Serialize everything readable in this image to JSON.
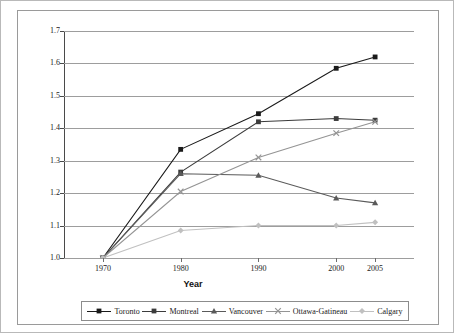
{
  "chart_data": {
    "type": "line",
    "title": "",
    "xlabel": "Year",
    "ylabel": "",
    "x": [
      1970,
      1980,
      1990,
      2000,
      2005
    ],
    "xtick_labels": [
      "1970",
      "1980",
      "1990",
      "2000",
      "2005"
    ],
    "ytick_labels": [
      "1.0",
      "1.1",
      "1.2",
      "1.3",
      "1.4",
      "1.5",
      "1.6",
      "1.7"
    ],
    "ytick_values": [
      1.0,
      1.1,
      1.2,
      1.3,
      1.4,
      1.5,
      1.6,
      1.7
    ],
    "ylim": [
      1.0,
      1.7
    ],
    "xlim": [
      1965,
      2010
    ],
    "grid": "horizontal",
    "legend_position": "bottom",
    "series": [
      {
        "name": "Toronto",
        "color": "#1a1a1a",
        "marker": "square",
        "values": [
          1.0,
          1.335,
          1.445,
          1.585,
          1.62
        ]
      },
      {
        "name": "Montreal",
        "color": "#3c3c3c",
        "marker": "square",
        "values": [
          1.0,
          1.265,
          1.42,
          1.43,
          1.425
        ]
      },
      {
        "name": "Vancouver",
        "color": "#5a5a5a",
        "marker": "triangle",
        "values": [
          1.0,
          1.26,
          1.255,
          1.185,
          1.17
        ]
      },
      {
        "name": "Ottawa-Gatineau",
        "color": "#949494",
        "marker": "x",
        "values": [
          1.0,
          1.205,
          1.31,
          1.385,
          1.42
        ]
      },
      {
        "name": "Calgary",
        "color": "#c0c0c0",
        "marker": "diamond",
        "values": [
          1.0,
          1.085,
          1.1,
          1.1,
          1.11
        ]
      }
    ]
  },
  "legend": {
    "entries": [
      {
        "label": "Toronto"
      },
      {
        "label": "Montreal"
      },
      {
        "label": "Vancouver"
      },
      {
        "label": "Ottawa-Gatineau"
      },
      {
        "label": "Calgary"
      }
    ]
  }
}
